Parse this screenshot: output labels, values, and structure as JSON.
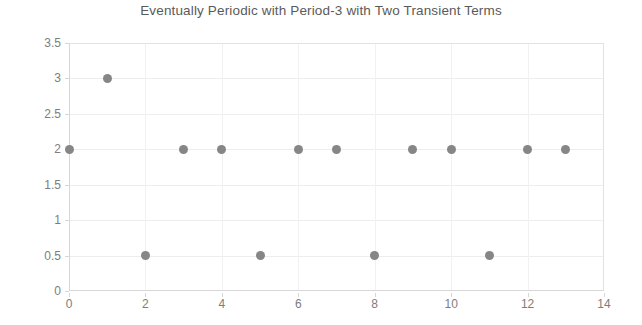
{
  "chart_data": {
    "type": "scatter",
    "title": "Eventually Periodic with Period-3 with Two Transient Terms",
    "xlabel": "",
    "ylabel": "",
    "xlim": [
      0,
      14
    ],
    "ylim": [
      0,
      3.5
    ],
    "x_ticks": [
      "0",
      "2",
      "4",
      "6",
      "8",
      "10",
      "12",
      "14"
    ],
    "x_tick_values": [
      0,
      2,
      4,
      6,
      8,
      10,
      12,
      14
    ],
    "y_ticks": [
      "0",
      "0.5",
      "1",
      "1.5",
      "2",
      "2.5",
      "3",
      "3.5"
    ],
    "y_tick_values": [
      0,
      0.5,
      1,
      1.5,
      2,
      2.5,
      3,
      3.5
    ],
    "grid": true,
    "grid_horizontal": true,
    "grid_vertical": true,
    "legend": false,
    "marker_color": "#868686",
    "marker_shape": "circle",
    "x": [
      0,
      1,
      2,
      3,
      4,
      5,
      6,
      7,
      8,
      9,
      10,
      11,
      12,
      13
    ],
    "values": [
      2,
      3,
      0.5,
      2,
      2,
      0.5,
      2,
      2,
      0.5,
      2,
      2,
      0.5,
      2,
      2
    ],
    "points": [
      {
        "x": 0,
        "y": 2
      },
      {
        "x": 1,
        "y": 3
      },
      {
        "x": 2,
        "y": 0.5
      },
      {
        "x": 3,
        "y": 2
      },
      {
        "x": 4,
        "y": 2
      },
      {
        "x": 5,
        "y": 0.5
      },
      {
        "x": 6,
        "y": 2
      },
      {
        "x": 7,
        "y": 2
      },
      {
        "x": 8,
        "y": 0.5
      },
      {
        "x": 9,
        "y": 2
      },
      {
        "x": 10,
        "y": 2
      },
      {
        "x": 11,
        "y": 0.5
      },
      {
        "x": 12,
        "y": 2
      },
      {
        "x": 13,
        "y": 2
      }
    ]
  },
  "colors": {
    "title": "#5a5a5a",
    "tick_label": "#7d7d7d",
    "gridline": "#ededed",
    "axis_line": "#d7d7d7",
    "marker": "#868686",
    "background": "#ffffff"
  }
}
